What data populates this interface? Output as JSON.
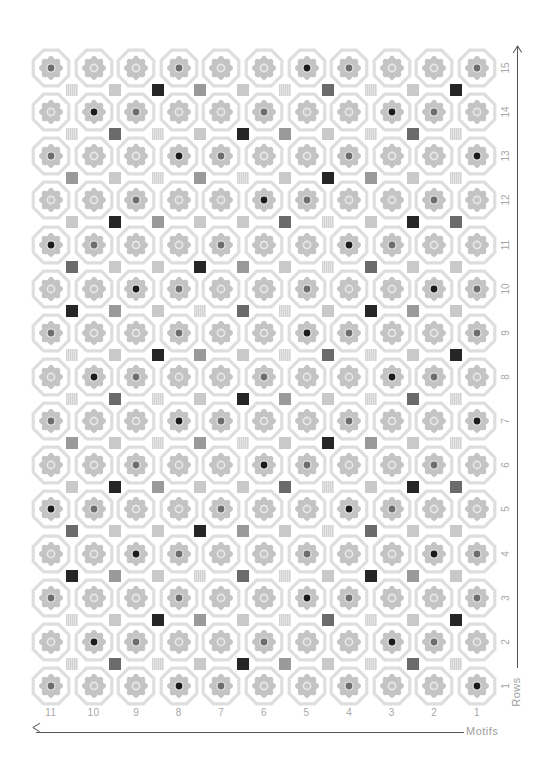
{
  "axes": {
    "x_title": "Motifs",
    "y_title": "Rows",
    "column_labels": [
      "11",
      "10",
      "9",
      "8",
      "7",
      "6",
      "5",
      "4",
      "3",
      "2",
      "1"
    ],
    "row_labels": [
      "15",
      "14",
      "13",
      "12",
      "11",
      "10",
      "9",
      "8",
      "7",
      "6",
      "5",
      "4",
      "3",
      "2",
      "1"
    ]
  },
  "legend_encoding": {
    "center_dot": {
      "0": "hollow ring",
      "1": "light dot",
      "2": "medium dot",
      "3": "black dot"
    },
    "square": {
      "h": "hatched light",
      "l": "light gray",
      "m": "medium gray",
      "d": "dark gray",
      "k": "black"
    }
  },
  "colors": {
    "octagon_outline": "#dedede",
    "flower_fill": "#c4c4c4",
    "ring": "#e9e9e9",
    "dot_light": "#a9a9a9",
    "dot_medium": "#6e6e6e",
    "dot_black": "#1c1c1c",
    "axis": "#555555",
    "label": "#a8a8a8"
  },
  "grid": {
    "columns": 11,
    "rows": 15,
    "origin_x": 51,
    "origin_y": 68,
    "step_x": 42.6,
    "step_y": 44.14
  },
  "motif_rows": [
    {
      "row": "15",
      "dots": [
        2,
        0,
        0,
        2,
        0,
        0,
        3,
        2,
        0,
        0,
        2
      ]
    },
    {
      "row": "14",
      "dots": [
        0,
        3,
        2,
        0,
        0,
        2,
        0,
        0,
        3,
        2,
        0
      ]
    },
    {
      "row": "13",
      "dots": [
        2,
        0,
        0,
        3,
        2,
        0,
        0,
        2,
        0,
        0,
        3
      ]
    },
    {
      "row": "12",
      "dots": [
        0,
        0,
        2,
        0,
        0,
        3,
        2,
        0,
        0,
        2,
        0
      ]
    },
    {
      "row": "11",
      "dots": [
        3,
        2,
        0,
        0,
        2,
        0,
        0,
        3,
        2,
        0,
        0
      ]
    },
    {
      "row": "10",
      "dots": [
        0,
        0,
        3,
        2,
        0,
        0,
        2,
        0,
        0,
        3,
        2
      ]
    },
    {
      "row": "9",
      "dots": [
        2,
        0,
        0,
        2,
        0,
        0,
        3,
        2,
        0,
        0,
        2
      ]
    },
    {
      "row": "8",
      "dots": [
        0,
        3,
        2,
        0,
        0,
        2,
        0,
        0,
        3,
        2,
        0
      ]
    },
    {
      "row": "7",
      "dots": [
        2,
        0,
        0,
        3,
        2,
        0,
        0,
        2,
        0,
        0,
        3
      ]
    },
    {
      "row": "6",
      "dots": [
        0,
        0,
        2,
        0,
        0,
        3,
        2,
        0,
        0,
        2,
        0
      ]
    },
    {
      "row": "5",
      "dots": [
        3,
        2,
        0,
        0,
        2,
        0,
        0,
        3,
        2,
        0,
        0
      ]
    },
    {
      "row": "4",
      "dots": [
        0,
        0,
        3,
        2,
        0,
        0,
        2,
        0,
        0,
        3,
        2
      ]
    },
    {
      "row": "3",
      "dots": [
        2,
        0,
        0,
        2,
        0,
        0,
        3,
        2,
        0,
        0,
        2
      ]
    },
    {
      "row": "2",
      "dots": [
        0,
        3,
        2,
        0,
        0,
        2,
        0,
        0,
        3,
        2,
        0
      ]
    },
    {
      "row": "1",
      "dots": [
        2,
        0,
        0,
        3,
        2,
        0,
        0,
        2,
        0,
        0,
        3
      ]
    }
  ],
  "square_rows": [
    [
      "h",
      "l",
      "k",
      "m",
      "l",
      "h",
      "d",
      "h",
      "l",
      "k"
    ],
    [
      "h",
      "d",
      "h",
      "l",
      "k",
      "m",
      "l",
      "h",
      "d",
      "h"
    ],
    [
      "m",
      "l",
      "h",
      "m",
      "h",
      "l",
      "k",
      "m",
      "l",
      "h"
    ],
    [
      "l",
      "k",
      "m",
      "l",
      "l",
      "d",
      "h",
      "l",
      "k",
      "d"
    ],
    [
      "d",
      "l",
      "l",
      "k",
      "m",
      "l",
      "h",
      "d",
      "l",
      "l"
    ],
    [
      "k",
      "m",
      "l",
      "h",
      "d",
      "h",
      "l",
      "k",
      "m",
      "l"
    ],
    [
      "h",
      "l",
      "k",
      "m",
      "l",
      "h",
      "d",
      "h",
      "l",
      "k"
    ],
    [
      "h",
      "d",
      "h",
      "l",
      "k",
      "m",
      "l",
      "h",
      "d",
      "h"
    ],
    [
      "m",
      "l",
      "h",
      "m",
      "h",
      "l",
      "k",
      "m",
      "l",
      "h"
    ],
    [
      "l",
      "k",
      "m",
      "l",
      "l",
      "d",
      "h",
      "l",
      "k",
      "d"
    ],
    [
      "d",
      "l",
      "l",
      "k",
      "m",
      "l",
      "h",
      "d",
      "l",
      "l"
    ],
    [
      "k",
      "m",
      "l",
      "h",
      "d",
      "h",
      "l",
      "k",
      "m",
      "l"
    ],
    [
      "h",
      "l",
      "k",
      "m",
      "l",
      "h",
      "d",
      "h",
      "l",
      "k"
    ],
    [
      "h",
      "d",
      "h",
      "l",
      "k",
      "m",
      "l",
      "h",
      "d",
      "h"
    ]
  ]
}
